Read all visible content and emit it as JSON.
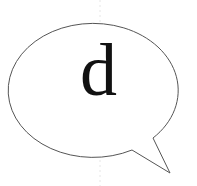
{
  "bubble": {
    "letter": "d",
    "stroke_color": "#555555",
    "fill_color": "#ffffff",
    "text_color": "#111111"
  }
}
